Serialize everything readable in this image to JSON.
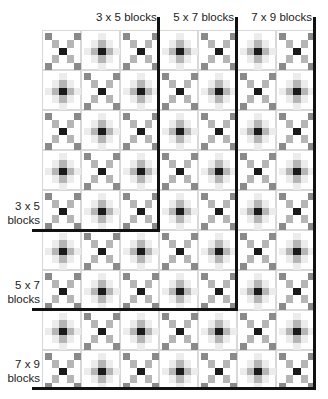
{
  "diagram": {
    "grid": {
      "columns": 7,
      "rows": 9,
      "block_width": 39,
      "block_height": 40,
      "pattern": "alternating X-block and plus-gradient block (checkerboard)"
    },
    "colors": {
      "line": "#111111",
      "dark": "#1a1a1a",
      "mid": "#8a8a8a",
      "light": "#b5b5b5",
      "pale": "#dcdcdc",
      "faint": "#ececec"
    },
    "top_labels": [
      {
        "text": "3 x 5 blocks",
        "columns": 3
      },
      {
        "text": "5 x 7 blocks",
        "columns": 5
      },
      {
        "text": "7 x 9 blocks",
        "columns": 7
      }
    ],
    "side_labels": [
      {
        "line1": "3 x 5",
        "line2": "blocks",
        "rows": 5
      },
      {
        "line1": "5 x 7",
        "line2": "blocks",
        "rows": 7
      },
      {
        "line1": "7 x 9",
        "line2": "blocks",
        "rows": 9
      }
    ]
  }
}
